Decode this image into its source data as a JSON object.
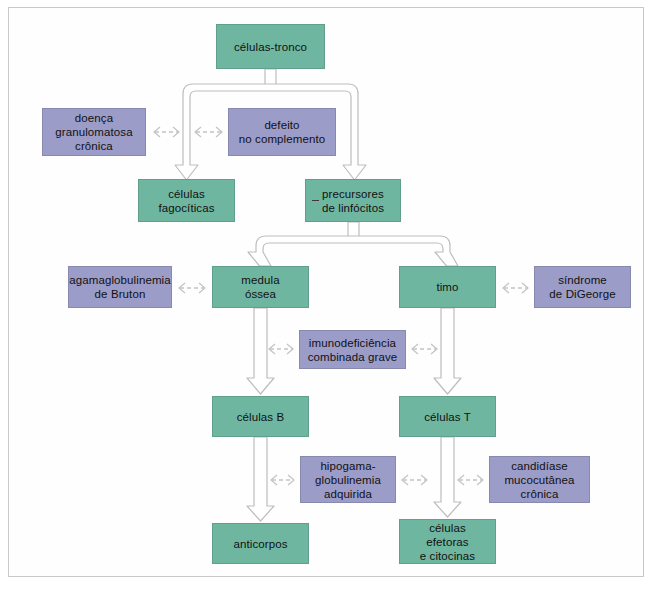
{
  "diagram": {
    "title": "células-tronco",
    "palette": {
      "green": "#6fb6a1",
      "purple": "#9c9cc9",
      "arrow_outline": "#b9b9b9",
      "frame": "#c9c9c9",
      "background": "#ffffff",
      "text": "#111111"
    },
    "nodes": [
      {
        "id": "celulas-tronco",
        "label": "células-tronco",
        "kind": "green",
        "x": 216,
        "y": 24,
        "w": 109,
        "h": 45
      },
      {
        "id": "doenca-granulomatosa-cronica",
        "label": "doença\ngranulomatosa\ncrônica",
        "kind": "purple",
        "x": 42,
        "y": 108,
        "w": 104,
        "h": 48
      },
      {
        "id": "defeito-no-complemento",
        "label": "defeito\nno complemento",
        "kind": "purple",
        "x": 228,
        "y": 108,
        "w": 108,
        "h": 48
      },
      {
        "id": "celulas-fagociticas",
        "label": "células\nfagocíticas",
        "kind": "green",
        "x": 138,
        "y": 179,
        "w": 97,
        "h": 43
      },
      {
        "id": "precursores-de-linfocitos",
        "label": "precursores\nde linfócitos",
        "kind": "green",
        "x": 305,
        "y": 179,
        "w": 96,
        "h": 43,
        "leading_dash": true
      },
      {
        "id": "agamaglobulinemia-de-bruton",
        "label": "agamaglobulinemia\nde Bruton",
        "kind": "purple",
        "x": 68,
        "y": 266,
        "w": 104,
        "h": 42
      },
      {
        "id": "medula-ossea",
        "label": "medula\nóssea",
        "kind": "green",
        "x": 212,
        "y": 266,
        "w": 97,
        "h": 42
      },
      {
        "id": "timo",
        "label": "timo",
        "kind": "green",
        "x": 399,
        "y": 266,
        "w": 97,
        "h": 42
      },
      {
        "id": "sindrome-de-digeorge",
        "label": "síndrome\nde DiGeorge",
        "kind": "purple",
        "x": 534,
        "y": 266,
        "w": 97,
        "h": 42
      },
      {
        "id": "imunodeficiencia-combinada-grave",
        "label": "imunodeficiência\ncombinada grave",
        "kind": "purple",
        "x": 299,
        "y": 330,
        "w": 107,
        "h": 39
      },
      {
        "id": "celulas-b",
        "label": "células B",
        "kind": "green",
        "x": 212,
        "y": 396,
        "w": 97,
        "h": 41
      },
      {
        "id": "celulas-t",
        "label": "células T",
        "kind": "green",
        "x": 399,
        "y": 396,
        "w": 97,
        "h": 41
      },
      {
        "id": "hipogamaglobulinemia-adquirida",
        "label": "hipogama-\nglobulinemia\nadquirida",
        "kind": "purple",
        "x": 300,
        "y": 456,
        "w": 96,
        "h": 47
      },
      {
        "id": "candidiase-mucocutanea-cronica",
        "label": "candidíase\nmucocutânea\ncrônica",
        "kind": "purple",
        "x": 489,
        "y": 456,
        "w": 101,
        "h": 47
      },
      {
        "id": "anticorpos",
        "label": "anticorpos",
        "kind": "green",
        "x": 212,
        "y": 523,
        "w": 97,
        "h": 41
      },
      {
        "id": "celulas-efetoras-e-citocinas",
        "label": "células\nefetoras\ne citocinas",
        "kind": "green",
        "x": 399,
        "y": 519,
        "w": 97,
        "h": 45
      }
    ],
    "flow_connections": [
      {
        "from": "celulas-tronco",
        "to": "celulas-fagociticas",
        "type": "split-arrow"
      },
      {
        "from": "celulas-tronco",
        "to": "precursores-de-linfocitos",
        "type": "split-arrow"
      },
      {
        "from": "precursores-de-linfocitos",
        "to": "medula-ossea",
        "type": "split-arrow"
      },
      {
        "from": "precursores-de-linfocitos",
        "to": "timo",
        "type": "split-arrow"
      },
      {
        "from": "medula-ossea",
        "to": "celulas-b",
        "type": "block-arrow"
      },
      {
        "from": "timo",
        "to": "celulas-t",
        "type": "block-arrow"
      },
      {
        "from": "celulas-b",
        "to": "anticorpos",
        "type": "block-arrow"
      },
      {
        "from": "celulas-t",
        "to": "celulas-efetoras-e-citocinas",
        "type": "block-arrow"
      }
    ],
    "disease_links": [
      {
        "from": "doenca-granulomatosa-cronica",
        "to": "celulas-tronco-branch-left",
        "type": "dashed-double-arrow"
      },
      {
        "from": "defeito-no-complemento",
        "to": "celulas-tronco-branch-left",
        "type": "dashed-double-arrow"
      },
      {
        "from": "agamaglobulinemia-de-bruton",
        "to": "medula-ossea",
        "type": "dashed-double-arrow"
      },
      {
        "from": "timo",
        "to": "sindrome-de-digeorge",
        "type": "dashed-double-arrow"
      },
      {
        "from": "imunodeficiencia-combinada-grave",
        "to": "medula-ossea-arrow",
        "type": "dashed-double-arrow"
      },
      {
        "from": "imunodeficiencia-combinada-grave",
        "to": "timo-arrow",
        "type": "dashed-double-arrow"
      },
      {
        "from": "hipogamaglobulinemia-adquirida",
        "to": "celulas-b-arrow",
        "type": "dashed-double-arrow"
      },
      {
        "from": "hipogamaglobulinemia-adquirida",
        "to": "celulas-t-arrow",
        "type": "dashed-double-arrow"
      },
      {
        "from": "candidiase-mucocutanea-cronica",
        "to": "celulas-t-arrow",
        "type": "dashed-double-arrow"
      }
    ]
  }
}
